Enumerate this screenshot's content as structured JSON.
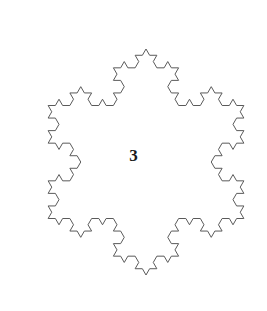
{
  "figure": {
    "name": "koch-snowflake",
    "iteration_label": "3",
    "background_color": "#ffffff",
    "stroke_color": "#5a5a5a",
    "stroke_width": 1,
    "fill": "none"
  },
  "chart_data": {
    "type": "line",
    "title": "",
    "subtitle": "",
    "xlabel": "",
    "ylabel": "",
    "grid": false,
    "legend": null,
    "annotations": [
      {
        "text": "3",
        "x": 146,
        "y": 158,
        "role": "iteration-number"
      }
    ],
    "curve": {
      "name": "Koch snowflake",
      "iterations": 3,
      "segments": 192,
      "initiator": "equilateral-triangle",
      "generator_angle_deg": 60,
      "center": [
        146,
        162
      ],
      "circumradius": 113,
      "rotation_deg": -90,
      "bounds": {
        "xmin": 35,
        "xmax": 257,
        "ymin": 31,
        "ymax": 293
      }
    }
  }
}
